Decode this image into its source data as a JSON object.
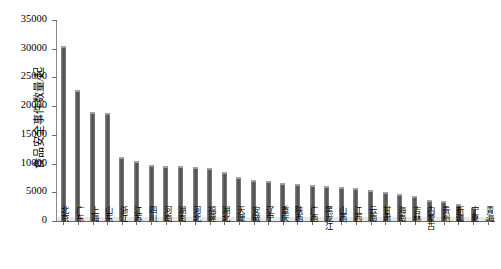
{
  "chart_data": {
    "type": "bar",
    "title": "",
    "subtitle": "",
    "xlabel": "",
    "ylabel": "食品安全事件数量/起",
    "ylim": [
      0,
      35000
    ],
    "ytick_labels": [
      "0",
      "5000",
      "10000",
      "15000",
      "20000",
      "25000",
      "30000",
      "35000"
    ],
    "ytick_values": [
      0,
      5000,
      10000,
      15000,
      20000,
      25000,
      30000,
      35000
    ],
    "grid": false,
    "legend": null,
    "legend_position": "none",
    "bar_color": "#5a5a5a",
    "categories": [
      "北京",
      "广东",
      "上海",
      "山东",
      "浙江",
      "江苏",
      "四川",
      "河南",
      "湖南",
      "河北",
      "福建",
      "湖北",
      "天津",
      "安徽",
      "辽宁",
      "重庆",
      "陕西",
      "广西",
      "黑龙江",
      "山西",
      "江西",
      "云南",
      "甘肃",
      "海南",
      "吉林",
      "内蒙古",
      "贵州",
      "新疆",
      "宁夏",
      "青海"
    ],
    "values": [
      30500,
      22800,
      18900,
      18800,
      11200,
      10400,
      9700,
      9600,
      9500,
      9400,
      9200,
      8600,
      7700,
      7200,
      6900,
      6600,
      6400,
      6300,
      6100,
      5900,
      5700,
      5400,
      5000,
      4700,
      4300,
      3600,
      3400,
      2900,
      2300,
      400
    ]
  }
}
